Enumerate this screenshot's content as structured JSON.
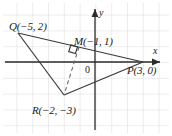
{
  "figure": {
    "type": "coordinate-geometry-diagram",
    "background_color": "#ffffff",
    "grid_color": "#d9d9dc",
    "line_color": "#3a3a3a",
    "axis_color": "#2b2b2b",
    "label_color": "#1a1a1a"
  },
  "axes": {
    "x_label": "x",
    "y_label": "y",
    "origin_label": "0",
    "grid_visible": true,
    "grid_spacing_px": 15.8,
    "origin_px": {
      "x": 95,
      "y": 62
    },
    "x_range": [
      -6,
      4.5
    ],
    "y_range": [
      -4.5,
      3.8
    ]
  },
  "points": [
    {
      "name": "Q",
      "label": "Q(−5, 2)",
      "x": -5,
      "y": 2,
      "px": {
        "x": 18,
        "y": 33
      },
      "label_px": {
        "x": 9,
        "y": 21
      }
    },
    {
      "name": "M",
      "label": "M(−1, 1)",
      "x": -1,
      "y": 1,
      "px": {
        "x": 79,
        "y": 47
      },
      "label_px": {
        "x": 74,
        "y": 36
      }
    },
    {
      "name": "P",
      "label": "P(3, 0)",
      "x": 3,
      "y": 0,
      "px": {
        "x": 143,
        "y": 62
      },
      "label_px": {
        "x": 127,
        "y": 65
      }
    },
    {
      "name": "R",
      "label": "R(−2, −3)",
      "x": -2,
      "y": -3,
      "px": {
        "x": 64,
        "y": 95
      },
      "label_px": {
        "x": 32,
        "y": 105
      }
    }
  ],
  "segments": [
    {
      "name": "QR",
      "from": "Q",
      "to": "R",
      "style": "solid"
    },
    {
      "name": "QP",
      "from": "Q",
      "to": "P",
      "style": "solid"
    },
    {
      "name": "RP",
      "from": "R",
      "to": "P",
      "style": "solid"
    },
    {
      "name": "MR",
      "from": "M",
      "to": "R",
      "style": "dashed"
    }
  ],
  "markers": {
    "right_angle": {
      "name": "right-angle-marker",
      "at_point": "M",
      "size_px": 9
    }
  }
}
